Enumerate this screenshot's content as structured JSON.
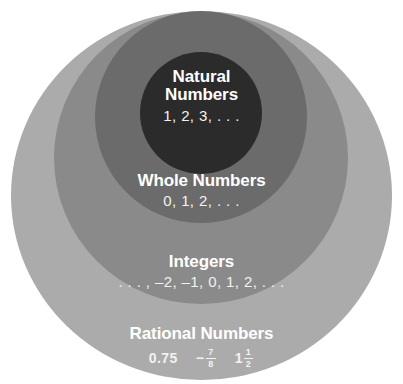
{
  "diagram": {
    "type": "nested-set-venn",
    "background_color": "#ffffff",
    "text_color": "#ffffff",
    "sets": [
      {
        "id": "rational",
        "name": "Rational Numbers",
        "fill_color": "#ababab",
        "level": 1,
        "examples_text": "0.75  − 7/8  1 1/2",
        "example_items": [
          {
            "kind": "decimal",
            "text": "0.75"
          },
          {
            "kind": "fraction",
            "sign": "−",
            "whole": "",
            "numerator": "7",
            "denominator": "8"
          },
          {
            "kind": "mixed",
            "sign": "",
            "whole": "1",
            "numerator": "1",
            "denominator": "2"
          }
        ]
      },
      {
        "id": "integers",
        "name": "Integers",
        "fill_color": "#8a8a8a",
        "level": 2,
        "examples_text": ". . . , –2, –1, 0, 1, 2, . . ."
      },
      {
        "id": "whole",
        "name": "Whole Numbers",
        "fill_color": "#6b6b6b",
        "level": 3,
        "examples_text": "0, 1, 2, . . ."
      },
      {
        "id": "natural",
        "name": "Natural Numbers",
        "name_line1": "Natural",
        "name_line2": "Numbers",
        "fill_color": "#2b2b2b",
        "level": 4,
        "examples_text": "1, 2, 3, . . ."
      }
    ]
  }
}
